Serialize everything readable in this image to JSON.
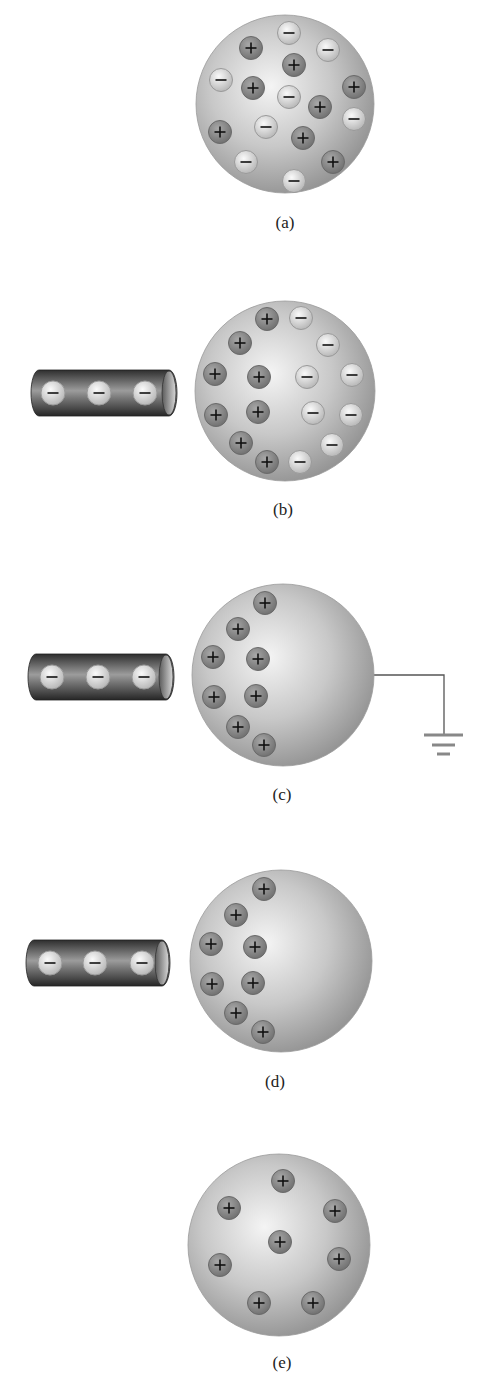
{
  "colors": {
    "background": "#ffffff",
    "sphere_light": "#f2f2f2",
    "sphere_mid": "#c4c4c4",
    "sphere_dark": "#969696",
    "positive_fill": "#8c8c8c",
    "positive_rim": "#6a6a6a",
    "negative_fill": "#e0e0e0",
    "negative_rim": "#9a9a9a",
    "rod_dark": "#3a3a3a",
    "rod_light": "#9a9a9a",
    "wire": "#555555",
    "ground": "#888888",
    "symbol": "#111111"
  },
  "panels": [
    {
      "id": "a",
      "label": "(a)",
      "label_pos": [
        285,
        223
      ],
      "sphere": {
        "cx": 285,
        "cy": 104,
        "r": 89
      },
      "rod": null,
      "ground": null,
      "charges": [
        {
          "sign": "-",
          "x": 289,
          "y": 33
        },
        {
          "sign": "-",
          "x": 328,
          "y": 50
        },
        {
          "sign": "+",
          "x": 251,
          "y": 48
        },
        {
          "sign": "+",
          "x": 294,
          "y": 65
        },
        {
          "sign": "-",
          "x": 221,
          "y": 80
        },
        {
          "sign": "+",
          "x": 253,
          "y": 88
        },
        {
          "sign": "-",
          "x": 289,
          "y": 97
        },
        {
          "sign": "+",
          "x": 320,
          "y": 107
        },
        {
          "sign": "+",
          "x": 354,
          "y": 87
        },
        {
          "sign": "-",
          "x": 354,
          "y": 119
        },
        {
          "sign": "+",
          "x": 220,
          "y": 132
        },
        {
          "sign": "-",
          "x": 266,
          "y": 127
        },
        {
          "sign": "+",
          "x": 303,
          "y": 138
        },
        {
          "sign": "-",
          "x": 246,
          "y": 162
        },
        {
          "sign": "+",
          "x": 333,
          "y": 162
        },
        {
          "sign": "-",
          "x": 294,
          "y": 181
        }
      ]
    },
    {
      "id": "b",
      "label": "(b)",
      "label_pos": [
        283,
        510
      ],
      "sphere": {
        "cx": 285,
        "cy": 391,
        "r": 90
      },
      "rod": {
        "x1": 31,
        "x2": 177,
        "cy": 393,
        "h": 46,
        "charges_x": [
          53,
          99,
          145
        ]
      },
      "ground": null,
      "charges": [
        {
          "sign": "+",
          "x": 267,
          "y": 319
        },
        {
          "sign": "+",
          "x": 240,
          "y": 343
        },
        {
          "sign": "+",
          "x": 215,
          "y": 374
        },
        {
          "sign": "+",
          "x": 259,
          "y": 377
        },
        {
          "sign": "+",
          "x": 216,
          "y": 415
        },
        {
          "sign": "+",
          "x": 258,
          "y": 412
        },
        {
          "sign": "+",
          "x": 241,
          "y": 443
        },
        {
          "sign": "+",
          "x": 267,
          "y": 462
        },
        {
          "sign": "-",
          "x": 301,
          "y": 318
        },
        {
          "sign": "-",
          "x": 328,
          "y": 345
        },
        {
          "sign": "-",
          "x": 307,
          "y": 377
        },
        {
          "sign": "-",
          "x": 352,
          "y": 375
        },
        {
          "sign": "-",
          "x": 313,
          "y": 413
        },
        {
          "sign": "-",
          "x": 351,
          "y": 415
        },
        {
          "sign": "-",
          "x": 332,
          "y": 445
        },
        {
          "sign": "-",
          "x": 300,
          "y": 462
        }
      ]
    },
    {
      "id": "c",
      "label": "(c)",
      "label_pos": [
        282,
        795
      ],
      "sphere": {
        "cx": 283,
        "cy": 675,
        "r": 91
      },
      "rod": {
        "x1": 28,
        "x2": 174,
        "cy": 677,
        "h": 46,
        "charges_x": [
          52,
          98,
          144
        ]
      },
      "ground": {
        "wire_start": [
          373,
          675
        ],
        "corner_x": 444,
        "wire_end_y": 735,
        "bars": [
          [
            424,
            463,
            735
          ],
          [
            432,
            455,
            745
          ],
          [
            437,
            450,
            754
          ]
        ]
      },
      "charges": [
        {
          "sign": "+",
          "x": 265,
          "y": 603
        },
        {
          "sign": "+",
          "x": 238,
          "y": 629
        },
        {
          "sign": "+",
          "x": 213,
          "y": 657
        },
        {
          "sign": "+",
          "x": 258,
          "y": 659
        },
        {
          "sign": "+",
          "x": 214,
          "y": 697
        },
        {
          "sign": "+",
          "x": 256,
          "y": 696
        },
        {
          "sign": "+",
          "x": 238,
          "y": 727
        },
        {
          "sign": "+",
          "x": 264,
          "y": 745
        }
      ]
    },
    {
      "id": "d",
      "label": "(d)",
      "label_pos": [
        275,
        1082
      ],
      "sphere": {
        "cx": 281,
        "cy": 961,
        "r": 91
      },
      "rod": {
        "x1": 26,
        "x2": 170,
        "cy": 963,
        "h": 46,
        "charges_x": [
          50,
          95,
          142
        ]
      },
      "ground": null,
      "charges": [
        {
          "sign": "+",
          "x": 264,
          "y": 889
        },
        {
          "sign": "+",
          "x": 236,
          "y": 915
        },
        {
          "sign": "+",
          "x": 211,
          "y": 944
        },
        {
          "sign": "+",
          "x": 255,
          "y": 947
        },
        {
          "sign": "+",
          "x": 212,
          "y": 984
        },
        {
          "sign": "+",
          "x": 253,
          "y": 983
        },
        {
          "sign": "+",
          "x": 236,
          "y": 1013
        },
        {
          "sign": "+",
          "x": 263,
          "y": 1032
        }
      ]
    },
    {
      "id": "e",
      "label": "(e)",
      "label_pos": [
        282,
        1363
      ],
      "sphere": {
        "cx": 279,
        "cy": 1245,
        "r": 91
      },
      "rod": null,
      "ground": null,
      "charges": [
        {
          "sign": "+",
          "x": 283,
          "y": 1181
        },
        {
          "sign": "+",
          "x": 229,
          "y": 1208
        },
        {
          "sign": "+",
          "x": 335,
          "y": 1211
        },
        {
          "sign": "+",
          "x": 280,
          "y": 1242
        },
        {
          "sign": "+",
          "x": 220,
          "y": 1265
        },
        {
          "sign": "+",
          "x": 339,
          "y": 1259
        },
        {
          "sign": "+",
          "x": 259,
          "y": 1303
        },
        {
          "sign": "+",
          "x": 313,
          "y": 1303
        }
      ]
    }
  ]
}
